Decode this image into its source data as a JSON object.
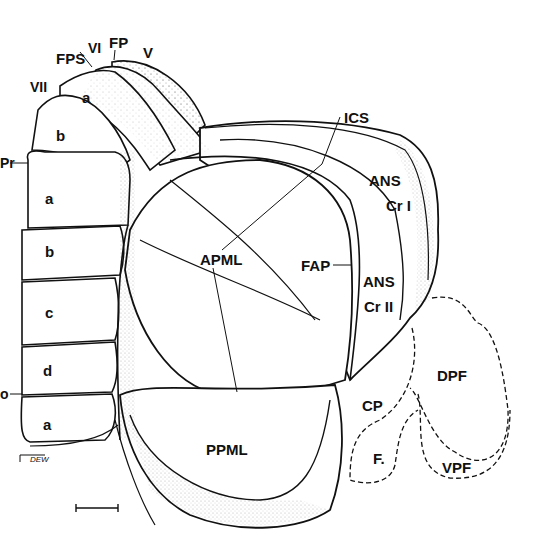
{
  "figure": {
    "signature": "DEW",
    "scale_bar": true,
    "colors": {
      "ink": "#111111",
      "stipple": "#2a2a2a",
      "background": "#ffffff"
    }
  },
  "labels": {
    "vii": "VII",
    "fps": "FPS",
    "vi": "VI",
    "fp": "FP",
    "v": "V",
    "vii_a": "a",
    "vii_b": "b",
    "pr": "Pr",
    "a1": "a",
    "b1": "b",
    "c1": "c",
    "d1": "d",
    "po": "o",
    "a2": "a",
    "ics": "ICS",
    "ans_cr1": "ANS",
    "cr1": "Cr I",
    "apml": "APML",
    "fap": "FAP",
    "ans_cr2": "ANS",
    "cr2": "Cr II",
    "dpf": "DPF",
    "cp": "CP",
    "f": "F.",
    "vpf": "VPF",
    "ppml": "PPML",
    "signature": "DEW"
  }
}
